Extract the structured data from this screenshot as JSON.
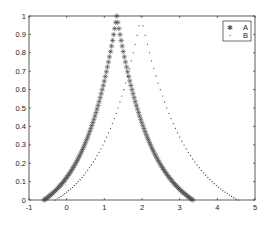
{
  "chart_data": {
    "type": "scatter",
    "title": "",
    "xlabel": "",
    "ylabel": "",
    "xlim": [
      -1,
      5
    ],
    "ylim": [
      0,
      1
    ],
    "xticks": [
      -1,
      0,
      1,
      2,
      3,
      4,
      5
    ],
    "yticks": [
      0,
      0.1,
      0.2,
      0.3,
      0.4,
      0.5,
      0.6,
      0.7,
      0.8,
      0.9,
      1
    ],
    "xtick_labels": [
      "-1",
      "0",
      "1",
      "2",
      "3",
      "4",
      "5"
    ],
    "ytick_labels": [
      "0",
      "0.1",
      "0.2",
      "0.3",
      "0.4",
      "0.5",
      "0.6",
      "0.7",
      "0.8",
      "0.9",
      "1"
    ],
    "grid": false,
    "legend_position": "upper right",
    "series": [
      {
        "name": "A",
        "marker": "asterisk",
        "color": "#555555",
        "start": -0.6,
        "peak": 1.33,
        "end": 3.35,
        "points": [
          [
            -0.6,
            0.0
          ],
          [
            -0.3,
            0.06
          ],
          [
            0.0,
            0.16
          ],
          [
            0.3,
            0.32
          ],
          [
            0.6,
            0.52
          ],
          [
            0.9,
            0.72
          ],
          [
            1.1,
            0.86
          ],
          [
            1.33,
            1.0
          ],
          [
            1.6,
            0.82
          ],
          [
            1.9,
            0.62
          ],
          [
            2.2,
            0.42
          ],
          [
            2.5,
            0.25
          ],
          [
            2.8,
            0.12
          ],
          [
            3.1,
            0.04
          ],
          [
            3.35,
            0.0
          ]
        ]
      },
      {
        "name": "B",
        "marker": "dot",
        "color": "#333333",
        "start": -0.3,
        "peak": 1.97,
        "end": 4.55,
        "points": [
          [
            -0.3,
            0.0
          ],
          [
            0.2,
            0.04
          ],
          [
            0.6,
            0.12
          ],
          [
            1.0,
            0.28
          ],
          [
            1.4,
            0.52
          ],
          [
            1.7,
            0.76
          ],
          [
            1.97,
            1.0
          ],
          [
            2.3,
            0.76
          ],
          [
            2.7,
            0.5
          ],
          [
            3.1,
            0.3
          ],
          [
            3.5,
            0.16
          ],
          [
            3.9,
            0.07
          ],
          [
            4.2,
            0.03
          ],
          [
            4.55,
            0.0
          ]
        ]
      }
    ]
  },
  "legend": {
    "items": [
      {
        "label": "A",
        "marker": "✱"
      },
      {
        "label": "B",
        "marker": "·"
      }
    ]
  }
}
